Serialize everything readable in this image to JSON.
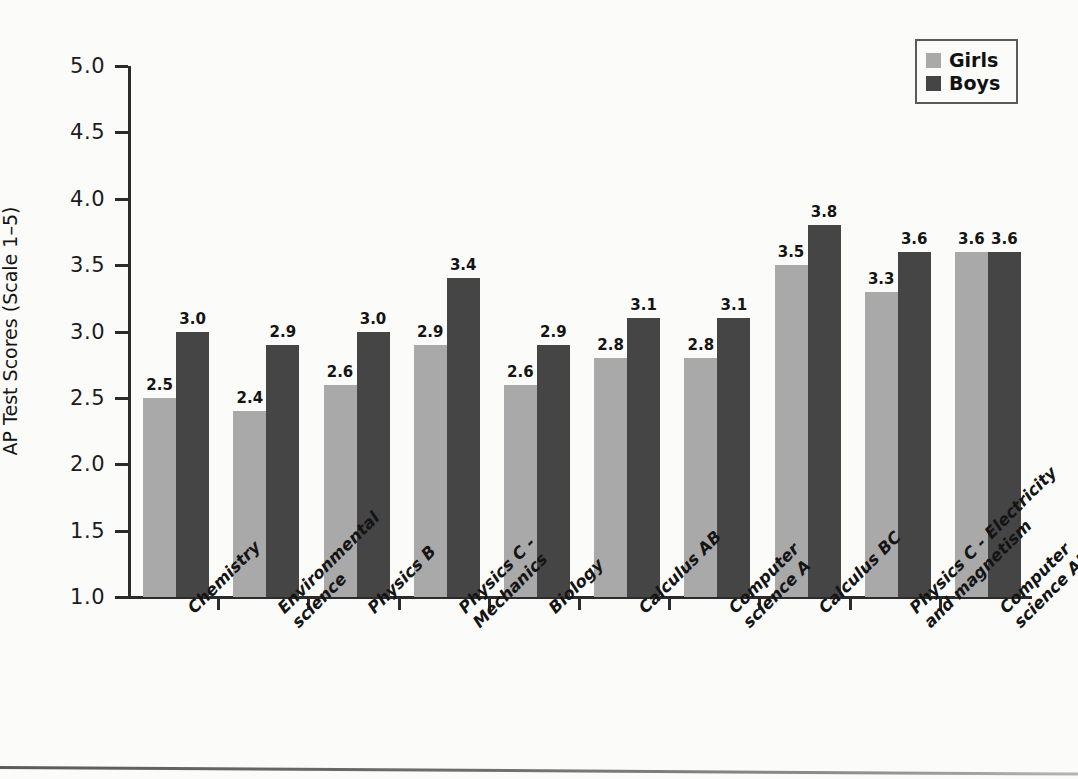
{
  "chart_data": {
    "type": "bar",
    "title": "",
    "xlabel": "",
    "ylabel": "AP Test Scores (Scale 1–5)",
    "ylim": [
      1.0,
      5.0
    ],
    "ytick_labels": [
      "5.0",
      "4.5",
      "4.0",
      "3.5",
      "3.0",
      "2.5",
      "2.0",
      "1.5",
      "1.0"
    ],
    "ytick_values": [
      5.0,
      4.5,
      4.0,
      3.5,
      3.0,
      2.5,
      2.0,
      1.5,
      1.0
    ],
    "grid": false,
    "legend_position": "top-right",
    "categories": [
      "Chemistry",
      "Environmental\nscience",
      "Physics B",
      "Physics C -\nMechanics",
      "Biology",
      "Calculus AB",
      "Computer\nscience A",
      "Calculus BC",
      "Physics C - Electricity\nand magnetism",
      "Computer\nscience AB"
    ],
    "series": [
      {
        "name": "Girls",
        "color": "#a9a9a9",
        "values": [
          2.5,
          2.4,
          2.6,
          2.9,
          2.6,
          2.8,
          2.8,
          3.5,
          3.3,
          3.6
        ],
        "labels": [
          "2.5",
          "2.4",
          "2.6",
          "2.9",
          "2.6",
          "2.8",
          "2.8",
          "3.5",
          "3.3",
          "3.6"
        ]
      },
      {
        "name": "Boys",
        "color": "#454545",
        "values": [
          3.0,
          2.9,
          3.0,
          3.4,
          2.9,
          3.1,
          3.1,
          3.8,
          3.6,
          3.6
        ],
        "labels": [
          "3.0",
          "2.9",
          "3.0",
          "3.4",
          "2.9",
          "3.1",
          "3.1",
          "3.8",
          "3.6",
          "3.6"
        ]
      }
    ]
  },
  "legend": {
    "items": [
      {
        "label": "Girls",
        "color": "#a9a9a9"
      },
      {
        "label": "Boys",
        "color": "#454545"
      }
    ]
  },
  "axis": {
    "y_title": "AP Test Scores (Scale 1–5)"
  }
}
